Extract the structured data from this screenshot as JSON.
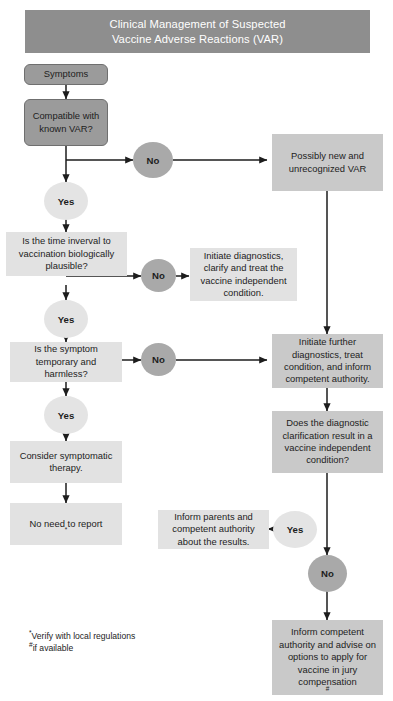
{
  "title": {
    "line1": "Clinical Management of Suspected",
    "line2": "Vaccine Adverse Reactions (VAR)"
  },
  "nodes": {
    "symptoms": "Symptoms",
    "compatible": "Compatible with known VAR?",
    "time_interval": "Is the time inverval to vaccination biologically plausible?",
    "symptom_temporary": "Is the symptom temporary and harmless?",
    "consider_therapy": "Consider symptomatic therapy.",
    "no_need_report": "No need to report",
    "no_need_report_mark": "*",
    "possibly_new": "Possibly new and unrecognized VAR",
    "initiate_diagnostics": "Initiate diagnostics, clarify and treat the vaccine independent condition.",
    "initiate_further": "Initiate further diagnostics, treat condition, and inform competent authority.",
    "does_diagnostic": "Does the diagnostic clarification result in a vaccine independent condition?",
    "inform_parents": "Inform parents and competent authority about the results.",
    "inform_competent": "Inform competent authority and advise on options to apply for vaccine in jury compensation",
    "inform_competent_mark": "#"
  },
  "decisions": {
    "no_1": "No",
    "yes_1": "Yes",
    "no_2": "No",
    "yes_2": "Yes",
    "no_3": "No",
    "yes_3": "Yes",
    "yes_4": "Yes",
    "no_4": "No"
  },
  "footnotes": {
    "mark_1": "*",
    "text_1": "Verify with local regulations",
    "mark_2": "#",
    "text_2": "if available"
  },
  "colors": {
    "title_bar": "#8e8e8e",
    "box_light": "#e2e2e2",
    "box_mid": "#c9c9c9",
    "box_dark": "#9b9b9b",
    "ellipse_yes": "#e4e4e4",
    "ellipse_no": "#a9a9a9",
    "connector": "#1d1d1d",
    "text": "#1d1d1d",
    "title_text": "#ffffff"
  }
}
